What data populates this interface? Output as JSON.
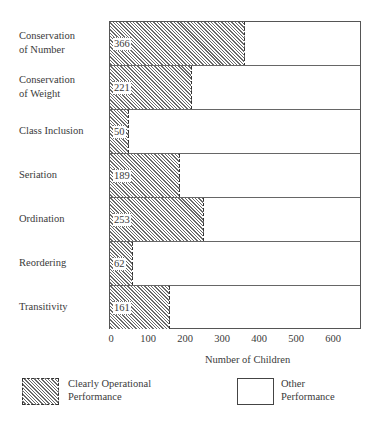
{
  "chart_data": {
    "type": "bar",
    "orientation": "horizontal",
    "stacked_reference_max": 680,
    "categories": [
      "Conservation of Number",
      "Conservation of Weight",
      "Class Inclusion",
      "Seriation",
      "Ordination",
      "Reordering",
      "Transitivity"
    ],
    "category_lines": [
      [
        "Conservation",
        "of Number"
      ],
      [
        "Conservation",
        "of Weight"
      ],
      [
        "Class Inclusion"
      ],
      [
        "Seriation"
      ],
      [
        "Ordination"
      ],
      [
        "Reordering"
      ],
      [
        "Transitivity"
      ]
    ],
    "series": [
      {
        "name": "Clearly Operational Performance",
        "pattern": "hatched",
        "values": [
          366,
          221,
          50,
          189,
          253,
          62,
          161
        ]
      },
      {
        "name": "Other Performance",
        "pattern": "blank",
        "values": [
          314,
          459,
          630,
          491,
          427,
          618,
          519
        ]
      }
    ],
    "value_labels": [
      "366",
      "221",
      "50",
      "189",
      "253",
      "62",
      "161"
    ],
    "xlabel": "Number of Children",
    "ylabel": "",
    "xticks": [
      0,
      100,
      200,
      300,
      400,
      500,
      600
    ],
    "xtick_labels": [
      "0",
      "100",
      "200",
      "300",
      "400",
      "500",
      "600"
    ],
    "xlim": [
      0,
      680
    ],
    "grid": false,
    "legend_position": "bottom",
    "title": ""
  },
  "legend": {
    "operational": {
      "line1": "Clearly Operational",
      "line2": "Performance"
    },
    "other": {
      "line1": "Other",
      "line2": "Performance"
    }
  },
  "layout": {
    "px_per_unit": 0.37
  }
}
